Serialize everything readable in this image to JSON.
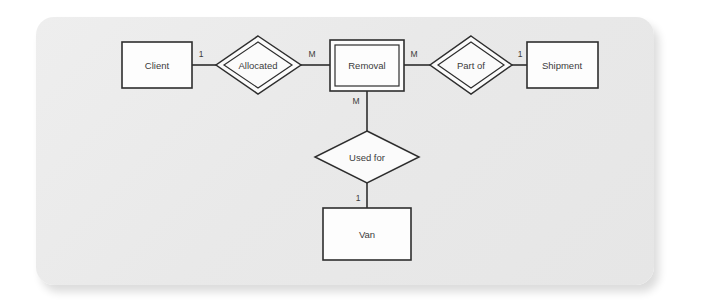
{
  "figure": {
    "panel_color": "#e9e9e9",
    "background_color": "#ffffff",
    "line_color": "#2e2e2e",
    "shape_fill": "#fdfdfd"
  },
  "diagram": {
    "type": "entity-relationship-diagram",
    "entities": [
      {
        "id": "client",
        "label": "Client",
        "border": "single"
      },
      {
        "id": "removal",
        "label": "Removal",
        "border": "double"
      },
      {
        "id": "shipment",
        "label": "Shipment",
        "border": "single"
      },
      {
        "id": "van",
        "label": "Van",
        "border": "single"
      }
    ],
    "relationships": [
      {
        "id": "allocated",
        "label": "Allocated",
        "border": "double"
      },
      {
        "id": "part-of",
        "label": "Part of",
        "border": "double"
      },
      {
        "id": "used-for",
        "label": "Used for",
        "border": "single"
      }
    ],
    "connections": [
      {
        "from": "client",
        "to": "allocated",
        "cardinality": "1"
      },
      {
        "from": "allocated",
        "to": "removal",
        "cardinality": "M"
      },
      {
        "from": "removal",
        "to": "part-of",
        "cardinality": "M"
      },
      {
        "from": "part-of",
        "to": "shipment",
        "cardinality": "1"
      },
      {
        "from": "removal",
        "to": "used-for",
        "cardinality": "M"
      },
      {
        "from": "used-for",
        "to": "van",
        "cardinality": "1"
      }
    ],
    "cardinality_labels": {
      "client_side": "1",
      "removal_left": "M",
      "removal_right": "M",
      "shipment_side": "1",
      "removal_bottom": "M",
      "van_top": "1"
    }
  }
}
